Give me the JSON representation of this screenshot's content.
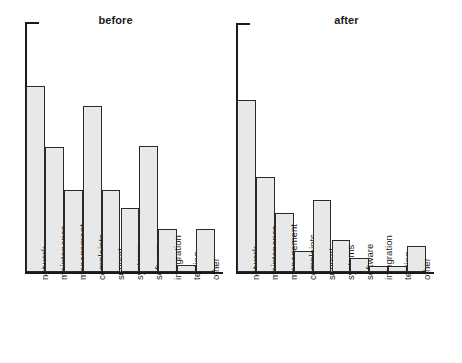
{
  "figure": {
    "width": 462,
    "height": 363,
    "background": "#ffffff",
    "bar_fill": "#e8e8e8",
    "bar_stroke": "#2b2b2b",
    "axis_color": "#1a1a1a"
  },
  "chart_data": [
    {
      "type": "bar",
      "title": "before",
      "xlabel": "",
      "ylabel": "",
      "grid": false,
      "legend": false,
      "ylim": [
        0,
        250
      ],
      "axis_top_tick": true,
      "categories": [
        "network",
        "maintenance",
        "management",
        "complaints",
        "support",
        "systems",
        "software",
        "integration",
        "testing",
        "other"
      ],
      "values": [
        186,
        125,
        82,
        166,
        82,
        64,
        126,
        43,
        7,
        43
      ]
    },
    {
      "type": "bar",
      "title": "after",
      "xlabel": "",
      "ylabel": "",
      "grid": false,
      "legend": false,
      "ylim": [
        0,
        250
      ],
      "axis_top_tick": true,
      "categories": [
        "network",
        "maintenance",
        "management",
        "complaints",
        "support",
        "systems",
        "software",
        "integration",
        "testing",
        "other"
      ],
      "values": [
        172,
        95,
        59,
        21,
        72,
        32,
        14,
        6,
        6,
        26
      ]
    }
  ],
  "panels": [
    {
      "name": "before-panel",
      "title": "before",
      "origin_x": 0,
      "axis_x": 25,
      "axis_top": 22,
      "baseline": 272,
      "bar_left": 26,
      "bar_width": 18.9,
      "label_y": 278,
      "categories": [
        {
          "label": "network",
          "top": 86
        },
        {
          "label": "maintenance",
          "top": 147
        },
        {
          "label": "management",
          "top": 190
        },
        {
          "label": "complaints",
          "top": 106
        },
        {
          "label": "support",
          "top": 190
        },
        {
          "label": "systems",
          "top": 208
        },
        {
          "label": "software",
          "top": 146
        },
        {
          "label": "integration",
          "top": 229
        },
        {
          "label": "testing",
          "top": 265
        },
        {
          "label": "other",
          "top": 229
        }
      ]
    },
    {
      "name": "after-panel",
      "title": "after",
      "origin_x": 231,
      "axis_x": 236,
      "axis_top": 23,
      "baseline": 272,
      "bar_left": 237,
      "bar_width": 18.9,
      "label_y": 278,
      "categories": [
        {
          "label": "network",
          "top": 100
        },
        {
          "label": "maintenance",
          "top": 177
        },
        {
          "label": "management",
          "top": 213
        },
        {
          "label": "complaints",
          "top": 251
        },
        {
          "label": "support",
          "top": 200
        },
        {
          "label": "systems",
          "top": 240
        },
        {
          "label": "software",
          "top": 258
        },
        {
          "label": "integration",
          "top": 266
        },
        {
          "label": "testing",
          "top": 266
        },
        {
          "label": "other",
          "top": 246
        }
      ]
    }
  ]
}
